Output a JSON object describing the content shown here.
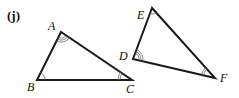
{
  "figure": {
    "part_label": "(j)",
    "triangles": [
      {
        "name": "ABC",
        "vertices": {
          "A": {
            "label": "A",
            "x": 61,
            "y": 32,
            "arcs": 3
          },
          "B": {
            "label": "B",
            "x": 37,
            "y": 80,
            "arcs": 1
          },
          "C": {
            "label": "C",
            "x": 132,
            "y": 80,
            "arcs": 2
          }
        }
      },
      {
        "name": "DEF",
        "vertices": {
          "D": {
            "label": "D",
            "x": 133,
            "y": 59,
            "arcs": 3
          },
          "E": {
            "label": "E",
            "x": 152,
            "y": 8,
            "arcs": 1
          },
          "F": {
            "label": "F",
            "x": 215,
            "y": 78,
            "arcs": 2
          }
        }
      }
    ],
    "colors": {
      "edge": "#1a1a1a",
      "arc": "#666666",
      "text": "#111111",
      "background": "#ffffff"
    }
  }
}
